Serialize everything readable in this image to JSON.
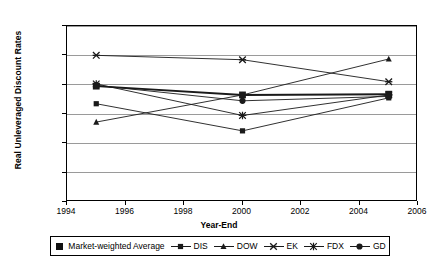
{
  "chart_data": {
    "type": "line",
    "title": "",
    "xlabel": "Year-End",
    "ylabel": "Real Unleveraged Discount Rates",
    "x": [
      1995,
      2000,
      2005
    ],
    "xlim": [
      1994,
      2006
    ],
    "ylim": [
      0,
      12
    ],
    "y_tick_labels": [
      "0.0%",
      "2.0%",
      "4.0%",
      "6.0%",
      "8.0%",
      "10.0%",
      "12.0%"
    ],
    "y_tick_values": [
      0,
      2,
      4,
      6,
      8,
      10,
      12
    ],
    "x_tick_labels": [
      "1994",
      "1996",
      "1998",
      "2000",
      "2002",
      "2004",
      "2006"
    ],
    "x_tick_values": [
      1994,
      1996,
      1998,
      2000,
      2002,
      2004,
      2006
    ],
    "grid": true,
    "legend_position": "bottom",
    "series": [
      {
        "name": "Market-weighted Average",
        "marker": "square-filled",
        "values": [
          7.9,
          7.3,
          7.35
        ]
      },
      {
        "name": "DIS",
        "marker": "square",
        "values": [
          6.7,
          4.85,
          7.1
        ]
      },
      {
        "name": "DOW",
        "marker": "triangle",
        "values": [
          5.45,
          7.3,
          9.75
        ]
      },
      {
        "name": "EK",
        "marker": "x",
        "values": [
          10.0,
          9.7,
          8.2
        ]
      },
      {
        "name": "FDX",
        "marker": "asterisk",
        "values": [
          8.05,
          5.9,
          7.3
        ]
      },
      {
        "name": "GD",
        "marker": "circle",
        "values": [
          7.95,
          6.9,
          7.2
        ]
      }
    ]
  },
  "axes": {
    "y_title": "Real Unleveraged Discount Rates",
    "x_title": "Year-End",
    "y_ticks": [
      "12.0%",
      "10.0%",
      "8.0%",
      "6.0%",
      "4.0%",
      "2.0%",
      "0.0%"
    ],
    "x_ticks": [
      "1994",
      "1996",
      "1998",
      "2000",
      "2002",
      "2004",
      "2006"
    ]
  },
  "legend": {
    "items": [
      {
        "label": "Market-weighted Average",
        "marker": "square-filled"
      },
      {
        "label": "DIS",
        "marker": "square"
      },
      {
        "label": "DOW",
        "marker": "triangle"
      },
      {
        "label": "EK",
        "marker": "x"
      },
      {
        "label": "FDX",
        "marker": "asterisk"
      },
      {
        "label": "GD",
        "marker": "circle"
      }
    ]
  },
  "colors": {
    "line": "#1a1a1a",
    "grid": "#9a9a9a",
    "axis": "#000000",
    "background": "#ffffff"
  }
}
